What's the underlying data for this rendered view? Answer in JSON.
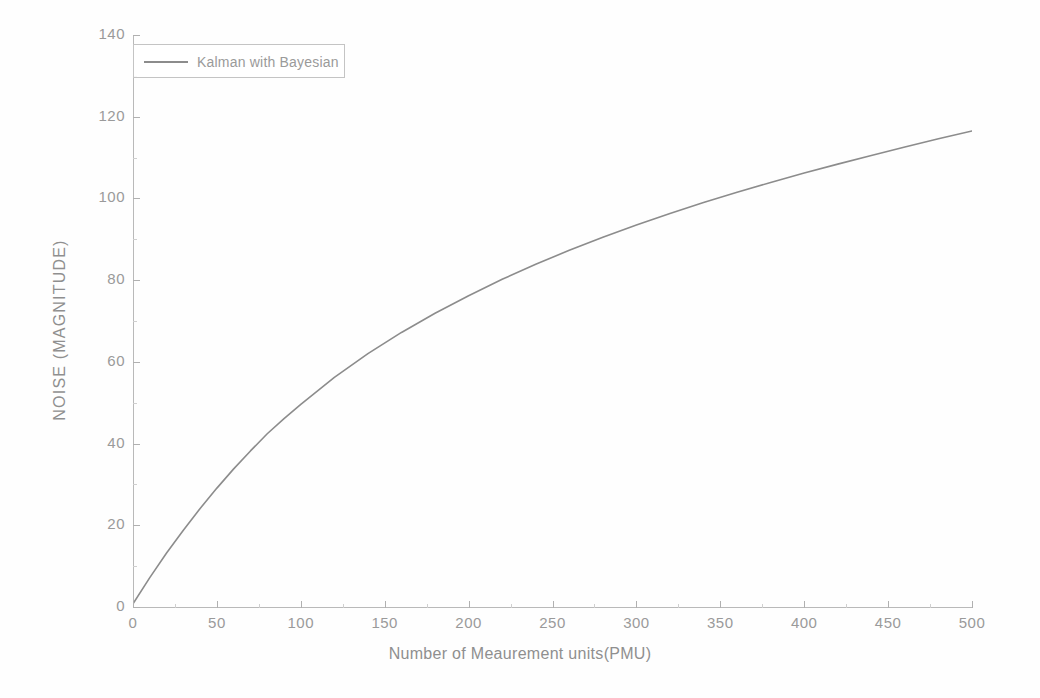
{
  "chart_data": {
    "type": "line",
    "title": "",
    "xlabel": "Number of Meaurement units(PMU)",
    "ylabel": "NOISE (MAGNITUDE)",
    "xlim": [
      0,
      500
    ],
    "ylim": [
      0,
      140
    ],
    "xticks": [
      0,
      50,
      100,
      150,
      200,
      250,
      300,
      350,
      400,
      450,
      500
    ],
    "yticks": [
      0,
      20,
      40,
      60,
      80,
      100,
      120,
      140
    ],
    "grid": false,
    "legend_position": "upper-left",
    "line_color": "#8c8c8c",
    "axis_color": "#b9b9b9",
    "tick_label_color": "#9a9a9a",
    "series": [
      {
        "name": "Kalman with Bayesian",
        "x": [
          0,
          10,
          20,
          30,
          40,
          50,
          60,
          70,
          80,
          90,
          100,
          120,
          140,
          160,
          180,
          200,
          220,
          240,
          260,
          280,
          300,
          320,
          340,
          360,
          380,
          400,
          420,
          440,
          460,
          480,
          500
        ],
        "values": [
          0.8,
          7.2,
          13.2,
          18.8,
          24.1,
          29.1,
          33.8,
          38.2,
          42.4,
          46.1,
          49.6,
          56.2,
          62.0,
          67.2,
          71.9,
          76.2,
          80.2,
          83.9,
          87.3,
          90.5,
          93.5,
          96.3,
          99.0,
          101.5,
          103.9,
          106.2,
          108.4,
          110.5,
          112.6,
          114.6,
          116.5
        ]
      }
    ]
  },
  "axes": {
    "ytick_labels": [
      "0",
      "20",
      "40",
      "60",
      "80",
      "100",
      "120",
      "140"
    ],
    "xtick_labels": [
      "0",
      "50",
      "100",
      "150",
      "200",
      "250",
      "300",
      "350",
      "400",
      "450",
      "500"
    ],
    "x_title": "Number of Meaurement units(PMU)",
    "y_title": "NOISE (MAGNITUDE)"
  },
  "legend": {
    "entries": [
      {
        "label": "Kalman with Bayesian",
        "color": "#8c8c8c"
      }
    ]
  }
}
